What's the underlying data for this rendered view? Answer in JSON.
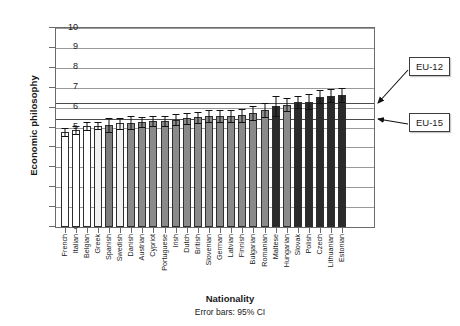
{
  "chart_data": {
    "type": "bar",
    "title": "",
    "xlabel": "Nationality",
    "ylabel": "Economic philosophy",
    "footnote": "Error bars: 95% CI",
    "ylim": [
      0,
      10
    ],
    "yticks": [
      0,
      1,
      2,
      3,
      4,
      5,
      6,
      7,
      8,
      9,
      10
    ],
    "grid": true,
    "legend_position": "none",
    "categories": [
      "French",
      "Italian",
      "Belgian",
      "Greek",
      "Spanish",
      "Swedish",
      "Danish",
      "Austrian",
      "Cypriot",
      "Portuguese",
      "Irish",
      "Dutch",
      "British",
      "Slovenian",
      "German",
      "Latvian",
      "Finnish",
      "Bulgarian",
      "Romanian",
      "Maltese",
      "Hungarian",
      "Slovak",
      "Polish",
      "Czech",
      "Lithuanian",
      "Estonian"
    ],
    "values": [
      4.75,
      4.87,
      5.08,
      5.1,
      5.12,
      5.22,
      5.25,
      5.27,
      5.32,
      5.34,
      5.4,
      5.46,
      5.52,
      5.56,
      5.58,
      5.6,
      5.62,
      5.72,
      5.88,
      6.1,
      6.15,
      6.28,
      6.3,
      6.55,
      6.6,
      6.63
    ],
    "err_low": [
      4.55,
      4.66,
      4.86,
      4.9,
      4.78,
      4.94,
      4.92,
      5.02,
      5.06,
      5.08,
      5.12,
      5.2,
      5.24,
      5.26,
      5.3,
      5.3,
      5.3,
      5.38,
      5.52,
      5.6,
      5.82,
      5.96,
      5.92,
      6.22,
      6.28,
      6.26
    ],
    "err_high": [
      4.95,
      5.08,
      5.3,
      5.3,
      5.46,
      5.5,
      5.58,
      5.52,
      5.58,
      5.6,
      5.68,
      5.72,
      5.8,
      5.86,
      5.86,
      5.9,
      5.94,
      6.06,
      6.24,
      6.6,
      6.48,
      6.6,
      6.68,
      6.88,
      6.92,
      7.0
    ],
    "bar_shades": [
      "#ffffff",
      "#ffffff",
      "#ffffff",
      "#f2f2f2",
      "#7d7d7d",
      "#f2f2f2",
      "#8a8a8a",
      "#8a8a8a",
      "#8a8a8a",
      "#8a8a8a",
      "#8a8a8a",
      "#8a8a8a",
      "#8a8a8a",
      "#8a8a8a",
      "#8a8a8a",
      "#8a8a8a",
      "#8a8a8a",
      "#8a8a8a",
      "#8a8a8a",
      "#2b2b2b",
      "#8a8a8a",
      "#2b2b2b",
      "#2b2b2b",
      "#2b2b2b",
      "#2b2b2b",
      "#2b2b2b"
    ],
    "reference_lines": [
      {
        "label": "EU-12",
        "value": 6.25
      },
      {
        "label": "EU-15",
        "value": 5.45
      }
    ]
  },
  "callouts": {
    "eu12_label": "EU-12",
    "eu15_label": "EU-15"
  },
  "axes": {
    "y_title": "Economic philosophy",
    "x_title": "Nationality",
    "footnote": "Error bars: 95% CI"
  },
  "colors": {
    "frame": "#6b6b6b",
    "grid": "#9a9a9a",
    "refline": "#4a4a4a",
    "bar_outline": "#2e2e2e",
    "error_bar": "#111111",
    "text": "#1a1a1a"
  }
}
